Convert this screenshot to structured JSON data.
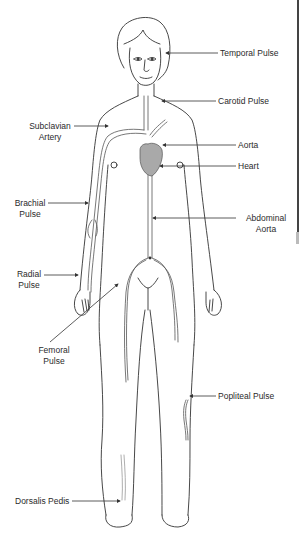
{
  "diagram": {
    "colors": {
      "line": "#333333",
      "heart_fill": "#a9a9a9",
      "background": "#ffffff",
      "text": "#2a2a2a"
    },
    "labels": {
      "temporal": "Temporal Pulse",
      "carotid": "Carotid Pulse",
      "subclavian_1": "Subclavian",
      "subclavian_2": "Artery",
      "aorta": "Aorta",
      "heart": "Heart",
      "brachial_1": "Brachial",
      "brachial_2": "Pulse",
      "abdominal_1": "Abdominal",
      "abdominal_2": "Aorta",
      "radial_1": "Radial",
      "radial_2": "Pulse",
      "femoral_1": "Femoral",
      "femoral_2": "Pulse",
      "popliteal": "Popliteal Pulse",
      "dorsalis": "Dorsalis Pedis"
    }
  }
}
